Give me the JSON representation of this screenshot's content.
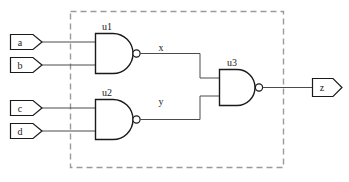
{
  "diagram": {
    "type": "digital-logic-schematic",
    "colors": {
      "background": "#ffffff",
      "wire": "#4a4a4a",
      "outline": "#1a1a1a",
      "group_border": "#9a9a9a"
    },
    "group_box": {
      "name": "module-boundary",
      "style": "dashed",
      "x": 70,
      "y": 11,
      "width": 213,
      "height": 156
    },
    "inputs": [
      {
        "id": "a",
        "label": "a",
        "x": 10,
        "y": 34,
        "width": 32,
        "height": 15
      },
      {
        "id": "b",
        "label": "b",
        "x": 10,
        "y": 57,
        "width": 32,
        "height": 15
      },
      {
        "id": "c",
        "label": "c",
        "x": 10,
        "y": 100,
        "width": 32,
        "height": 15
      },
      {
        "id": "d",
        "label": "d",
        "x": 10,
        "y": 123,
        "width": 32,
        "height": 15
      }
    ],
    "outputs": [
      {
        "id": "z",
        "label": "z",
        "x": 312,
        "y": 78,
        "width": 30,
        "height": 17
      }
    ],
    "gates": [
      {
        "id": "u1",
        "label": "u1",
        "type": "NAND",
        "inputs": [
          "a",
          "b"
        ],
        "output": "x",
        "x": 95,
        "y": 33,
        "width": 36,
        "height": 40,
        "label_x": 106,
        "label_y": 30
      },
      {
        "id": "u2",
        "label": "u2",
        "type": "NAND",
        "inputs": [
          "c",
          "d"
        ],
        "output": "y",
        "x": 95,
        "y": 99,
        "width": 36,
        "height": 40,
        "label_x": 106,
        "label_y": 96
      },
      {
        "id": "u3",
        "label": "u3",
        "type": "NAND",
        "inputs": [
          "x",
          "y"
        ],
        "output": "z",
        "x": 219,
        "y": 69,
        "width": 36,
        "height": 36,
        "label_x": 231,
        "label_y": 66
      }
    ],
    "nets": [
      {
        "id": "x",
        "label": "x",
        "from": "u1",
        "to": "u3",
        "label_x": 161,
        "label_y": 51
      },
      {
        "id": "y",
        "label": "y",
        "from": "u2",
        "to": "u3",
        "label_x": 161,
        "label_y": 105
      }
    ]
  }
}
